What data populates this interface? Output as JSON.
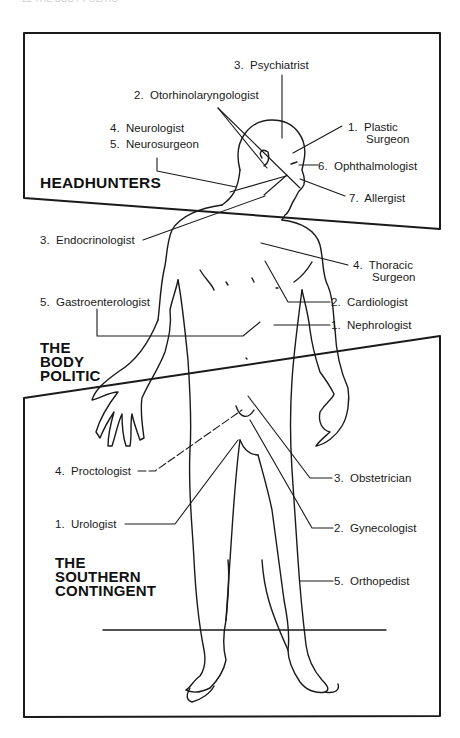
{
  "page_header": "22        THE BODY POLITIC",
  "sections": {
    "headhunters": "HEADHUNTERS",
    "body_politic": [
      "THE",
      "BODY",
      "POLITIC"
    ],
    "southern_contingent": [
      "THE",
      "SOUTHERN",
      "CONTINGENT"
    ]
  },
  "labels": {
    "headhunters": [
      {
        "num": "1.",
        "name": "Plastic",
        "name2": "Surgeon"
      },
      {
        "num": "2.",
        "name": "Otorhinolaryngologist"
      },
      {
        "num": "3.",
        "name": "Psychiatrist"
      },
      {
        "num": "4.",
        "name": "Neurologist"
      },
      {
        "num": "5.",
        "name": "Neurosurgeon"
      },
      {
        "num": "6.",
        "name": "Ophthalmologist"
      },
      {
        "num": "7.",
        "name": "Allergist"
      }
    ],
    "body_politic": [
      {
        "num": "1.",
        "name": "Nephrologist"
      },
      {
        "num": "2.",
        "name": "Cardiologist"
      },
      {
        "num": "3.",
        "name": "Endocrinologist"
      },
      {
        "num": "4.",
        "name": "Thoracic",
        "name2": "Surgeon"
      },
      {
        "num": "5.",
        "name": "Gastroenterologist"
      }
    ],
    "southern_contingent": [
      {
        "num": "1.",
        "name": "Urologist"
      },
      {
        "num": "2.",
        "name": "Gynecologist"
      },
      {
        "num": "3.",
        "name": "Obstetrician"
      },
      {
        "num": "4.",
        "name": "Proctologist"
      },
      {
        "num": "5.",
        "name": "Orthopedist"
      }
    ]
  },
  "colors": {
    "ink": "#1a1a1a",
    "paper": "#ffffff"
  }
}
